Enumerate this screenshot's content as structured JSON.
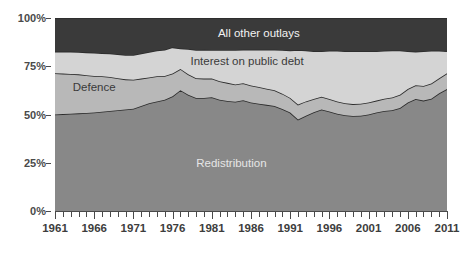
{
  "chart_data": {
    "type": "area",
    "stacked": true,
    "title": "",
    "xlabel": "",
    "ylabel": "",
    "ylim": [
      0,
      100
    ],
    "xlim": [
      1961,
      2011
    ],
    "grid": false,
    "legend_position": "inline-labels",
    "y_tick_labels": [
      "0%",
      "25%",
      "50%",
      "75%",
      "100%"
    ],
    "y_tick_values": [
      0,
      25,
      50,
      75,
      100
    ],
    "x_tick_labels": [
      "1961",
      "1966",
      "1971",
      "1976",
      "1981",
      "1986",
      "1991",
      "1996",
      "2001",
      "2006",
      "2011"
    ],
    "x_tick_values": [
      1961,
      1966,
      1971,
      1976,
      1981,
      1986,
      1991,
      1996,
      2001,
      2006,
      2011
    ],
    "x_minor_tick_step": 1,
    "x": [
      1961,
      1962,
      1963,
      1964,
      1965,
      1966,
      1967,
      1968,
      1969,
      1970,
      1971,
      1972,
      1973,
      1974,
      1975,
      1976,
      1977,
      1978,
      1979,
      1980,
      1981,
      1982,
      1983,
      1984,
      1985,
      1986,
      1987,
      1988,
      1989,
      1990,
      1991,
      1992,
      1993,
      1994,
      1995,
      1996,
      1997,
      1998,
      1999,
      2000,
      2001,
      2002,
      2003,
      2004,
      2005,
      2006,
      2007,
      2008,
      2009,
      2010,
      2011
    ],
    "series": [
      {
        "name": "Redistribution",
        "color": "#888888",
        "label_color": "#e6e6e6",
        "values": [
          50.0,
          50.2,
          50.4,
          50.6,
          50.8,
          51.0,
          51.4,
          51.8,
          52.2,
          52.6,
          53.0,
          54.4,
          55.8,
          56.8,
          57.6,
          59.4,
          62.6,
          60.2,
          58.6,
          58.6,
          59.0,
          57.6,
          57.0,
          56.6,
          57.4,
          56.2,
          55.6,
          55.0,
          54.4,
          52.8,
          51.0,
          47.4,
          49.4,
          51.2,
          52.6,
          51.6,
          50.4,
          49.6,
          49.2,
          49.4,
          50.0,
          51.0,
          51.8,
          52.2,
          53.4,
          56.2,
          58.0,
          57.2,
          58.2,
          61.0,
          63.2
        ]
      },
      {
        "name": "Defence",
        "color": "#b8b8b8",
        "label_color": "#3a3a3a",
        "values": [
          21.4,
          21.0,
          20.6,
          20.2,
          19.6,
          19.0,
          18.4,
          17.6,
          16.6,
          15.6,
          15.0,
          14.2,
          13.4,
          13.0,
          12.4,
          11.8,
          11.0,
          10.6,
          10.2,
          10.0,
          9.6,
          9.6,
          9.4,
          9.0,
          8.8,
          8.8,
          8.6,
          8.4,
          8.2,
          8.0,
          7.6,
          7.8,
          7.4,
          6.8,
          6.6,
          6.4,
          6.4,
          6.2,
          6.2,
          6.2,
          6.2,
          6.2,
          6.4,
          6.6,
          6.8,
          7.0,
          7.2,
          7.6,
          7.8,
          7.8,
          8.2
        ]
      },
      {
        "name": "Interest on public debt",
        "color": "#d4d4d4",
        "label_color": "#3a3a3a",
        "values": [
          11.2,
          11.4,
          11.6,
          11.6,
          11.8,
          12.0,
          12.0,
          12.2,
          12.4,
          12.6,
          12.8,
          13.0,
          13.2,
          13.4,
          13.6,
          13.6,
          10.6,
          13.2,
          14.6,
          15.0,
          14.8,
          16.2,
          17.0,
          17.8,
          17.4,
          18.6,
          19.4,
          20.2,
          21.0,
          22.6,
          24.6,
          28.2,
          26.4,
          24.8,
          23.6,
          25.0,
          26.2,
          27.0,
          27.4,
          27.2,
          26.6,
          25.6,
          24.8,
          24.4,
          23.0,
          19.6,
          17.4,
          18.0,
          17.0,
          14.2,
          11.4
        ]
      },
      {
        "name": "All other outlays",
        "color": "#3a3a3a",
        "label_color": "#f2f2f2",
        "values": [
          17.4,
          17.4,
          17.4,
          17.6,
          17.8,
          18.0,
          18.2,
          18.4,
          18.8,
          19.2,
          19.2,
          18.4,
          17.6,
          16.8,
          16.4,
          15.2,
          15.8,
          16.0,
          16.6,
          16.4,
          16.6,
          16.6,
          16.6,
          16.6,
          16.4,
          16.4,
          16.4,
          16.4,
          16.4,
          16.6,
          16.8,
          16.6,
          16.8,
          17.2,
          17.2,
          17.0,
          17.0,
          17.2,
          17.2,
          17.2,
          17.2,
          17.2,
          17.0,
          16.8,
          16.8,
          17.2,
          17.4,
          17.2,
          17.0,
          17.0,
          17.2
        ]
      }
    ],
    "annotations": [
      {
        "text": "All other outlays",
        "x_pct": 52,
        "y_pct": 92,
        "series": "All other outlays"
      },
      {
        "text": "Interest on public debt",
        "x_pct": 49,
        "y_pct": 77.5,
        "series": "Interest on public debt"
      },
      {
        "text": "Defence",
        "x_pct": 10,
        "y_pct": 64,
        "series": "Defence"
      },
      {
        "text": "Redistribution",
        "x_pct": 45,
        "y_pct": 25,
        "series": "Redistribution"
      }
    ],
    "axis_color": "#4a4a4a"
  }
}
